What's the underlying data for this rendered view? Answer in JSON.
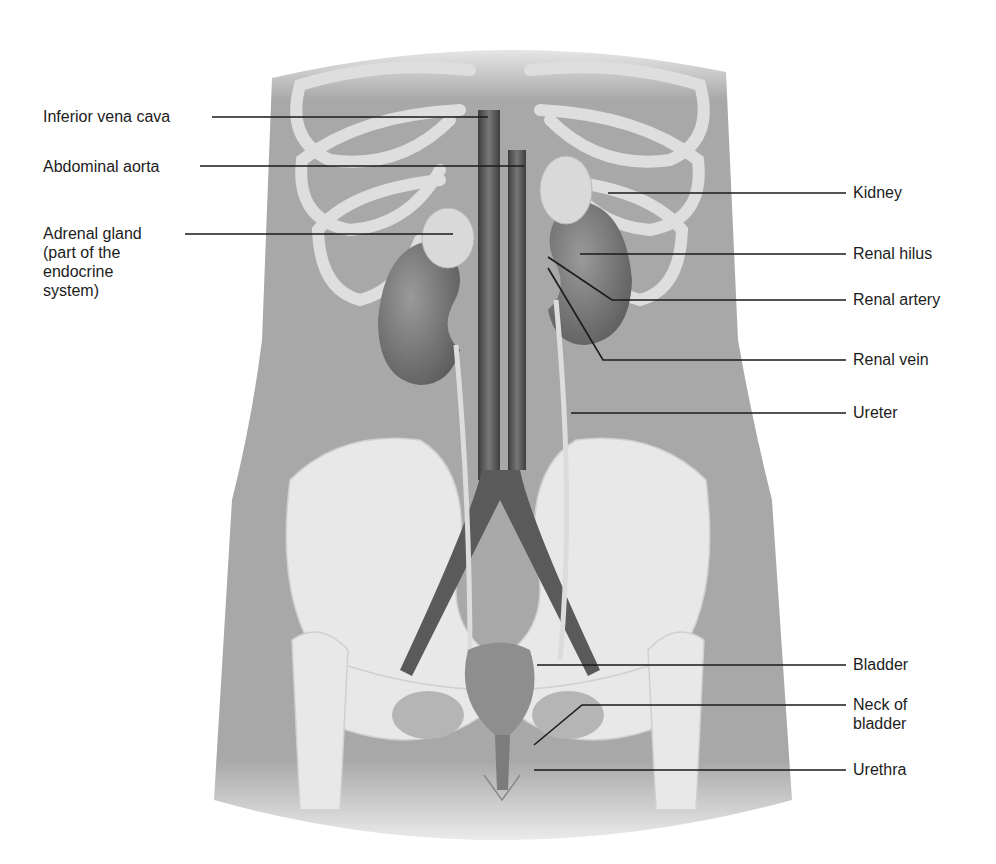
{
  "figure": {
    "colors": {
      "background": "#ffffff",
      "body_skin": "#a9a9a9",
      "bone": "#e6e6e6",
      "vessel": "#555555",
      "organ": "#7a7a7a",
      "adrenal": "#d8d8d8",
      "leader_line": "#1a1a1a",
      "label_text": "#1c1c1c"
    }
  },
  "labels": {
    "left": [
      {
        "id": "inferior-vena-cava",
        "text": "Inferior vena cava"
      },
      {
        "id": "abdominal-aorta",
        "text": "Abdominal aorta"
      },
      {
        "id": "adrenal-gland",
        "lines": [
          "Adrenal gland",
          "(part of the",
          "endocrine",
          "system)"
        ]
      }
    ],
    "right": [
      {
        "id": "kidney",
        "text": "Kidney"
      },
      {
        "id": "renal-hilus",
        "text": "Renal hilus"
      },
      {
        "id": "renal-artery",
        "text": "Renal artery"
      },
      {
        "id": "renal-vein",
        "text": "Renal vein"
      },
      {
        "id": "ureter",
        "text": "Ureter"
      },
      {
        "id": "bladder",
        "text": "Bladder"
      },
      {
        "id": "neck-of-bladder",
        "lines": [
          "Neck of",
          "bladder"
        ]
      },
      {
        "id": "urethra",
        "text": "Urethra"
      }
    ]
  }
}
